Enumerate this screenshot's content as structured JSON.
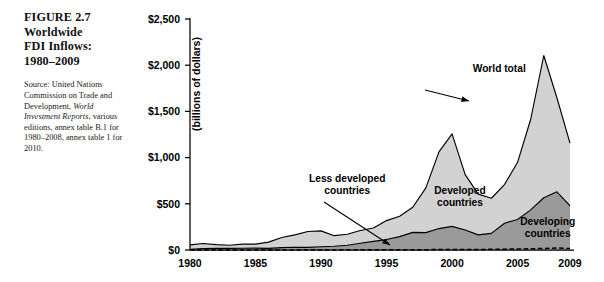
{
  "figure": {
    "number_label": "FIGURE 2.7",
    "title_lines": [
      "Worldwide",
      "FDI Inflows:",
      "1980–2009"
    ],
    "source_prefix": "Source: United Nations Commission on Trade and Development, ",
    "source_italic": "World Investment Reports",
    "source_suffix": ", various editions, annex table B.1 for 1980–2008, annex table 1 for 2010."
  },
  "colors": {
    "developed_fill": "#d2d2d2",
    "developing_fill": "#9a9a9a",
    "line": "#000000",
    "axis": "#000000",
    "background": "#ffffff"
  },
  "chart_data": {
    "type": "area",
    "title": "Worldwide FDI Inflows: 1980–2009",
    "xlabel": "",
    "ylabel": "(billions of dollars)",
    "ylim": [
      0,
      2500
    ],
    "xlim": [
      1980,
      2009
    ],
    "grid": false,
    "stacked": true,
    "legend_position": "inline-annotations",
    "ytick_labels": [
      "$0",
      "$500",
      "$1,000",
      "$1,500",
      "$2,000",
      "$2,500"
    ],
    "ytick_values": [
      0,
      500,
      1000,
      1500,
      2000,
      2500
    ],
    "xtick_labels": [
      "1980",
      "1985",
      "1990",
      "1995",
      "2000",
      "2005",
      "2009"
    ],
    "xtick_values": [
      1980,
      1985,
      1990,
      1995,
      2000,
      2005,
      2009
    ],
    "x": [
      1980,
      1981,
      1982,
      1983,
      1984,
      1985,
      1986,
      1987,
      1988,
      1989,
      1990,
      1991,
      1992,
      1993,
      1994,
      1995,
      1996,
      1997,
      1998,
      1999,
      2000,
      2001,
      2002,
      2003,
      2004,
      2005,
      2006,
      2007,
      2008,
      2009
    ],
    "series": [
      {
        "name": "Developing countries",
        "annotation": "Developing countries",
        "values": [
          8,
          16,
          18,
          17,
          19,
          20,
          17,
          25,
          30,
          28,
          35,
          41,
          51,
          73,
          93,
          113,
          145,
          191,
          188,
          232,
          256,
          216,
          164,
          180,
          290,
          330,
          434,
          565,
          630,
          478
        ]
      },
      {
        "name": "Developed countries",
        "annotation": "Developed countries",
        "values": [
          47,
          54,
          40,
          34,
          44,
          44,
          68,
          110,
          134,
          172,
          172,
          114,
          120,
          138,
          145,
          205,
          220,
          272,
          484,
          830,
          1000,
          600,
          441,
          380,
          418,
          619,
          981,
          1540,
          1018,
          678
        ]
      }
    ],
    "total_series": {
      "name": "World total",
      "annotation": "World total",
      "values": [
        55,
        70,
        58,
        51,
        63,
        64,
        85,
        135,
        164,
        200,
        207,
        155,
        171,
        211,
        238,
        318,
        365,
        463,
        672,
        1062,
        1256,
        816,
        605,
        560,
        708,
        949,
        1415,
        2105,
        1648,
        1156
      ]
    },
    "reference_line": {
      "name": "Less developed countries",
      "annotation": "Less developed countries",
      "style": "dashed",
      "values": [
        0.5,
        0.6,
        0.6,
        0.6,
        0.6,
        0.7,
        0.7,
        0.9,
        1.3,
        1.7,
        1.1,
        1.3,
        1.5,
        1.7,
        1.6,
        1.8,
        2.1,
        2.6,
        3.4,
        5.4,
        4.4,
        5.9,
        5.2,
        7.4,
        9.3,
        11.0,
        12.9,
        16.6,
        22.0,
        15.5
      ]
    },
    "annotations": [
      {
        "text": "World total",
        "x": 2003.6,
        "y": 1930
      },
      {
        "text": "Developed countries",
        "x": 2000.6,
        "y": 610
      },
      {
        "text": "Developing countries",
        "x": 2007.3,
        "y": 270
      },
      {
        "text": "Less developed countries",
        "x": 1992.0,
        "y": 740
      }
    ]
  }
}
